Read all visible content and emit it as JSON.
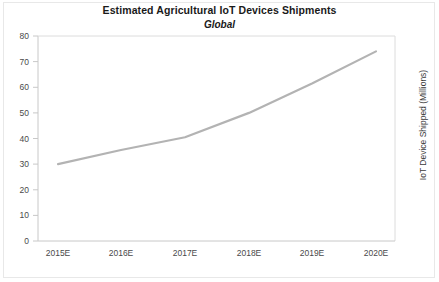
{
  "chart_data": {
    "type": "line",
    "title": "Estimated Agricultural IoT Devices Shipments",
    "subtitle": "Global",
    "xlabel": "",
    "ylabel": "IoT Device Shipped (Millions)",
    "categories": [
      "2015E",
      "2016E",
      "2017E",
      "2018E",
      "2019E",
      "2020E"
    ],
    "values": [
      30,
      35.5,
      40.5,
      50,
      61.5,
      74
    ],
    "series": [
      {
        "name": "IoT Device Shipped (Millions)",
        "values": [
          30,
          35.5,
          40.5,
          50,
          61.5,
          74
        ]
      }
    ],
    "ylim": [
      0,
      80
    ],
    "ytick_labels": [
      "0",
      "10",
      "20",
      "30",
      "40",
      "50",
      "60",
      "70",
      "80"
    ],
    "ytick_values": [
      0,
      10,
      20,
      30,
      40,
      50,
      60,
      70,
      80
    ],
    "grid": false,
    "legend": false,
    "line_color": "#b3b3b3",
    "axis_color": "#c8c8c8",
    "text_color": "#3a3a3a"
  }
}
